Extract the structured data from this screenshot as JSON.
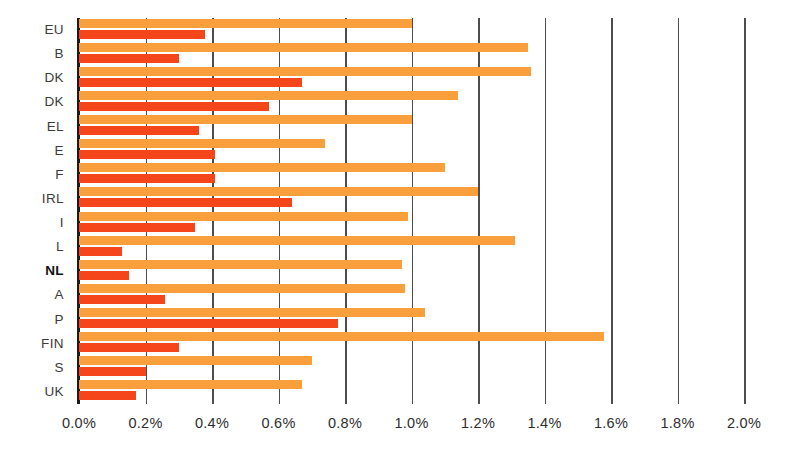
{
  "chart_data": {
    "type": "bar",
    "orientation": "horizontal",
    "title": "",
    "subtitle": "",
    "xlabel": "",
    "ylabel": "",
    "xlim": [
      0.0,
      2.0
    ],
    "grid": true,
    "legend_position": "none",
    "categories": [
      "EU",
      "B",
      "DK",
      "DK",
      "EL",
      "E",
      "F",
      "IRL",
      "I",
      "L",
      "NL",
      "A",
      "P",
      "FIN",
      "S",
      "UK"
    ],
    "highlight_category": "NL",
    "x_tick_labels": [
      "0.0%",
      "0.2%",
      "0.4%",
      "0.6%",
      "0.8%",
      "1.0%",
      "1.2%",
      "1.4%",
      "1.6%",
      "1.8%",
      "2.0%"
    ],
    "x_tick_values": [
      0.0,
      0.2,
      0.4,
      0.6,
      0.8,
      1.0,
      1.2,
      1.4,
      1.6,
      1.8,
      2.0
    ],
    "series": [
      {
        "name": "series-orange",
        "color": "#f9a03c",
        "values": [
          1.0,
          1.35,
          1.36,
          1.14,
          1.0,
          0.74,
          1.1,
          1.2,
          0.99,
          1.31,
          0.97,
          0.98,
          1.04,
          1.58,
          0.7,
          0.67
        ]
      },
      {
        "name": "series-red",
        "color": "#f4451b",
        "values": [
          0.38,
          0.3,
          0.67,
          0.57,
          0.36,
          0.41,
          0.41,
          0.64,
          0.35,
          0.13,
          0.15,
          0.26,
          0.78,
          0.3,
          0.2,
          0.17
        ]
      }
    ]
  },
  "colors": {
    "orange": "#f9a03c",
    "red": "#f4451b",
    "gridline": "#4d4d4d",
    "axis": "#1a1a1a",
    "label": "#3b3b3b",
    "background": "#ffffff"
  }
}
